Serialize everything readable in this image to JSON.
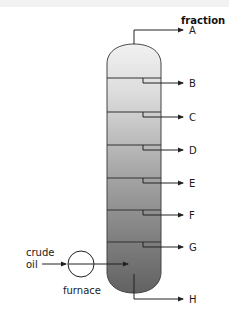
{
  "diagram": {
    "title": "fraction",
    "column": {
      "gradient_top": "#efefef",
      "gradient_bottom": "#666666",
      "outline": "#444444"
    },
    "fractions": [
      {
        "label": "A",
        "y": 40
      },
      {
        "label": "B",
        "y": 83
      },
      {
        "label": "C",
        "y": 117
      },
      {
        "label": "D",
        "y": 150
      },
      {
        "label": "E",
        "y": 183
      },
      {
        "label": "F",
        "y": 215
      },
      {
        "label": "G",
        "y": 247
      },
      {
        "label": "H",
        "y": 299
      }
    ],
    "input": {
      "label_line1": "crude",
      "label_line2": "oil",
      "heater_label": "furnace"
    }
  }
}
